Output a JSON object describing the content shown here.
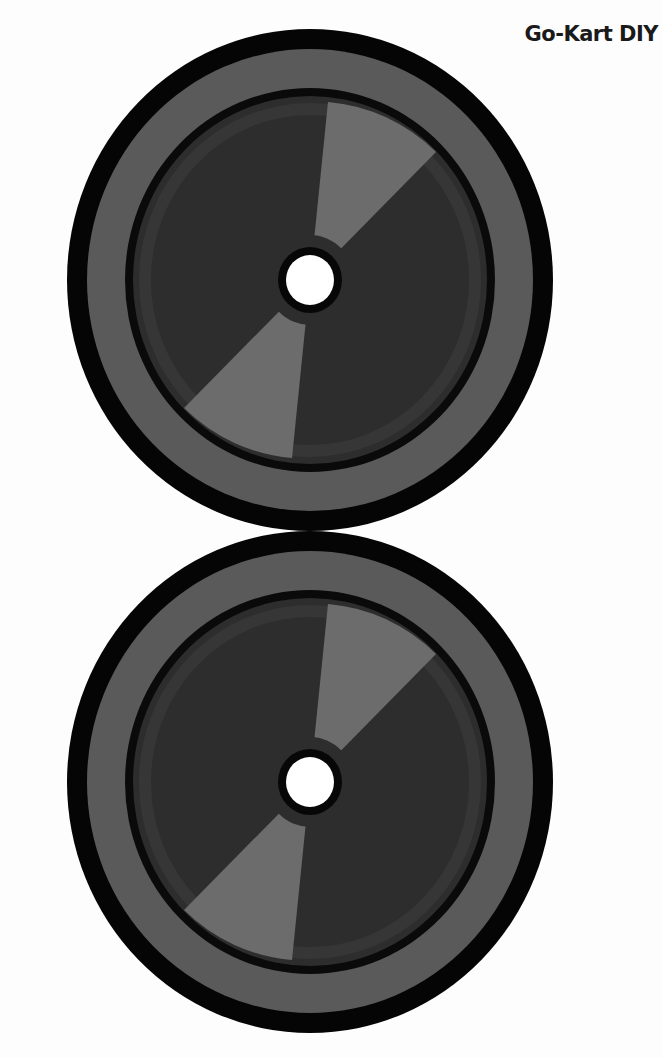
{
  "header": {
    "title": "Go-Kart DIY"
  },
  "colors": {
    "background": "#fdfdfd",
    "outer_ring": "#050505",
    "tire_band": "#5a5a5a",
    "inner_ring": "#0a0a0a",
    "hub": "#2d2d2d",
    "hub_band": "#3a3a3a",
    "sector": "#6c6c6c",
    "center_hole": "#ffffff"
  },
  "wheels": [
    {
      "label": "wheel-top"
    },
    {
      "label": "wheel-bottom"
    }
  ]
}
